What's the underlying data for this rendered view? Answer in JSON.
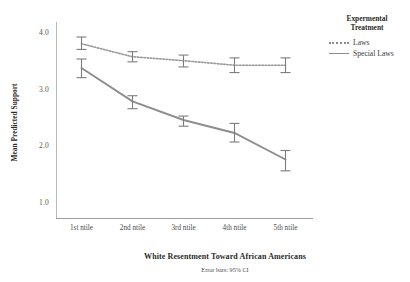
{
  "chart_data": {
    "type": "line",
    "title": "",
    "xlabel": "White Resentment Toward African Americans",
    "ylabel": "Mean Predicted Support",
    "categories": [
      "1st ntile",
      "2nd ntile",
      "3rd ntile",
      "4th ntile",
      "5th ntile"
    ],
    "ylim": [
      0.75,
      4.15
    ],
    "yticks": [
      "1.0",
      "2.0",
      "3.0",
      "4.0"
    ],
    "ytick_values": [
      1.0,
      2.0,
      3.0,
      4.0
    ],
    "grid": false,
    "legend_position": "right",
    "annotation": "Error bars: 95% CI",
    "series": [
      {
        "name": "Laws",
        "style": "dotted",
        "color": "#9a9a9a",
        "values": [
          3.8,
          3.57,
          3.5,
          3.42,
          3.42
        ],
        "ci_low": [
          3.7,
          3.48,
          3.39,
          3.29,
          3.29
        ],
        "ci_high": [
          3.92,
          3.66,
          3.6,
          3.55,
          3.55
        ]
      },
      {
        "name": "Special Laws",
        "style": "solid",
        "color": "#8d8d8d",
        "values": [
          3.37,
          2.78,
          2.45,
          2.22,
          1.75
        ],
        "ci_low": [
          3.2,
          2.65,
          2.34,
          2.06,
          1.55
        ],
        "ci_high": [
          3.53,
          2.88,
          2.52,
          2.39,
          1.91
        ]
      }
    ]
  },
  "legend": {
    "title_line1": "Expermental",
    "title_line2": "Treatment",
    "items": [
      {
        "label": "Laws",
        "style": "dotted"
      },
      {
        "label": "Special Laws",
        "style": "solid"
      }
    ]
  },
  "axes": {
    "y_title": "Mean Predicted Support",
    "x_title": "White Resentment Toward African Americans",
    "footnote": "Error bars: 95% CI"
  },
  "colors": {
    "line": "#8d8d8d",
    "axis": "#b0b0b0",
    "text": "#333333"
  }
}
